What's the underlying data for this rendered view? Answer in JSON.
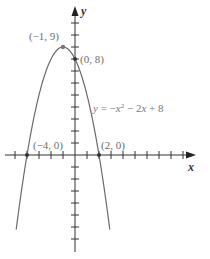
{
  "chart_data": {
    "type": "line",
    "title": "",
    "xlabel": "x",
    "ylabel": "y",
    "equation": "y = −x² − 2x + 8",
    "series": [
      {
        "name": "y = -x^2 - 2x + 8",
        "function": "-x^2 - 2x + 8",
        "x_range": [
          -4.9,
          2.9
        ],
        "x": [
          -4.9,
          -4,
          -3,
          -2,
          -1,
          0,
          1,
          2,
          2.9
        ],
        "values": [
          -6.21,
          0,
          5,
          8,
          9,
          8,
          5,
          0,
          -6.21
        ]
      }
    ],
    "annotations": [
      {
        "label": "(−1, 9)",
        "x": -1,
        "y": 9,
        "note": "vertex"
      },
      {
        "label": "(0, 8)",
        "x": 0,
        "y": 8,
        "note": "y-intercept"
      },
      {
        "label": "(−4, 0)",
        "x": -4,
        "y": 0,
        "note": "x-intercept"
      },
      {
        "label": "(2, 0)",
        "x": 2,
        "y": 0,
        "note": "x-intercept"
      }
    ],
    "xlim": [
      -5,
      8
    ],
    "ylim": [
      -8,
      11
    ],
    "grid": false,
    "tick_step": 1,
    "legend": null
  },
  "labels": {
    "x_axis": "x",
    "y_axis": "y",
    "equation": "y = −x² − 2x + 8",
    "vertex": "(−1, 9)",
    "y_intercept": "(0, 8)",
    "x_intercept_left": "(−4, 0)",
    "x_intercept_right": "(2, 0)"
  },
  "colors": {
    "curve": "#6a6a6a",
    "axis": "#333333",
    "label": "#6e6e6e"
  }
}
